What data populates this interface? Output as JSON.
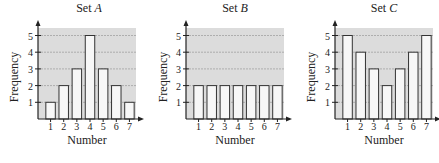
{
  "chart_data": [
    {
      "type": "bar",
      "title": "Set A",
      "title_prefix": "Set ",
      "title_var": "A",
      "xlabel": "Number",
      "ylabel": "Frequency",
      "categories": [
        "1",
        "2",
        "3",
        "4",
        "5",
        "6",
        "7"
      ],
      "values": [
        1,
        2,
        3,
        5,
        3,
        2,
        1
      ],
      "yticks": [
        "1",
        "2",
        "3",
        "4",
        "5"
      ],
      "ylim": [
        0,
        5.5
      ],
      "grid": true
    },
    {
      "type": "bar",
      "title": "Set B",
      "title_prefix": "Set ",
      "title_var": "B",
      "xlabel": "Number",
      "ylabel": "Frequency",
      "categories": [
        "1",
        "2",
        "3",
        "4",
        "5",
        "6",
        "7"
      ],
      "values": [
        2,
        2,
        2,
        2,
        2,
        2,
        2
      ],
      "yticks": [
        "1",
        "2",
        "3",
        "4",
        "5"
      ],
      "ylim": [
        0,
        5.5
      ],
      "grid": true
    },
    {
      "type": "bar",
      "title": "Set C",
      "title_prefix": "Set ",
      "title_var": "C",
      "xlabel": "Number",
      "ylabel": "Frequency",
      "categories": [
        "1",
        "2",
        "3",
        "4",
        "5",
        "6",
        "7"
      ],
      "values": [
        5,
        4,
        3,
        2,
        3,
        4,
        5
      ],
      "yticks": [
        "1",
        "2",
        "3",
        "4",
        "5"
      ],
      "ylim": [
        0,
        5.5
      ],
      "grid": true
    }
  ],
  "colors": {
    "plot_background": "#dcdcdc",
    "bar_fill": "#f7f7f7",
    "bar_stroke": "#333333",
    "grid": "#9a9a9a",
    "axis": "#222222"
  }
}
